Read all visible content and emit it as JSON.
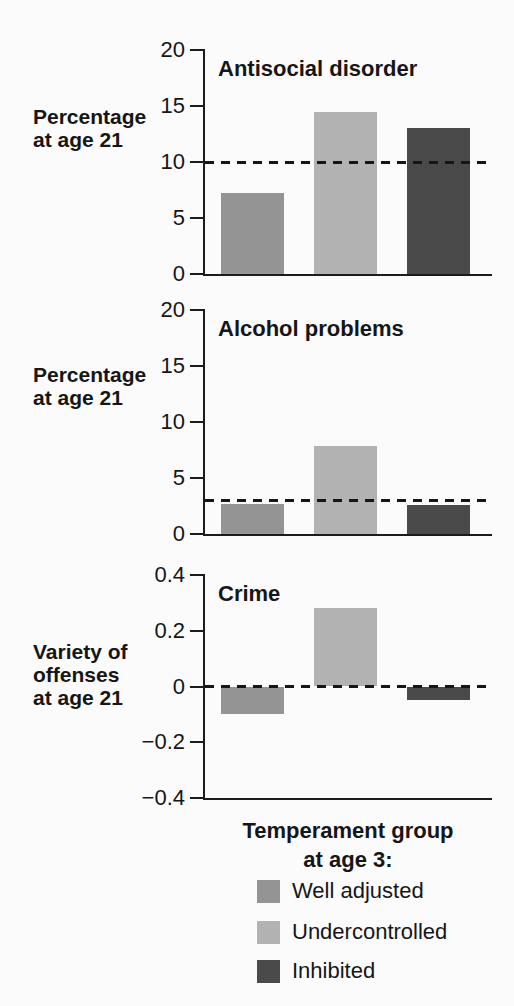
{
  "figure": {
    "background": "#fbfbfb",
    "axis_color": "#1c1c1c",
    "text_color": "#161616"
  },
  "x_axis_title": {
    "line1": "Temperament group",
    "line2": "at age 3:"
  },
  "legend": {
    "items": [
      {
        "label": "Well adjusted",
        "color": "#949494"
      },
      {
        "label": "Undercontrolled",
        "color": "#b2b2b2"
      },
      {
        "label": "Inhibited",
        "color": "#4a4a4a"
      }
    ]
  },
  "chart_data": [
    {
      "type": "bar",
      "title": "Antisocial disorder",
      "ylabel_lines": [
        "Percentage",
        "at age 21"
      ],
      "categories": [
        "Well adjusted",
        "Undercontrolled",
        "Inhibited"
      ],
      "values": [
        7.2,
        14.5,
        13.0
      ],
      "ylim": [
        0,
        20
      ],
      "yticks": [
        0,
        5,
        10,
        15,
        20
      ],
      "ytick_labels": [
        "0",
        "5",
        "10",
        "15",
        "20"
      ],
      "reference_line": 10,
      "reference_style": "dashed",
      "grid": false,
      "legend_position": "below-figure"
    },
    {
      "type": "bar",
      "title": "Alcohol problems",
      "ylabel_lines": [
        "Percentage",
        "at age 21"
      ],
      "categories": [
        "Well adjusted",
        "Undercontrolled",
        "Inhibited"
      ],
      "values": [
        2.7,
        7.9,
        2.6
      ],
      "ylim": [
        0,
        20
      ],
      "yticks": [
        0,
        5,
        10,
        15,
        20
      ],
      "ytick_labels": [
        "0",
        "5",
        "10",
        "15",
        "20"
      ],
      "reference_line": 3,
      "reference_style": "dashed",
      "grid": false,
      "legend_position": "below-figure"
    },
    {
      "type": "bar",
      "title": "Crime",
      "ylabel_lines": [
        "Variety of",
        "offenses",
        "at age 21"
      ],
      "categories": [
        "Well adjusted",
        "Undercontrolled",
        "Inhibited"
      ],
      "values": [
        -0.1,
        0.28,
        -0.05
      ],
      "ylim": [
        -0.4,
        0.4
      ],
      "yticks": [
        -0.4,
        -0.2,
        0,
        0.2,
        0.4
      ],
      "ytick_labels": [
        "−0.4",
        "−0.2",
        "0",
        "0.2",
        "0.4"
      ],
      "reference_line": 0,
      "reference_style": "dashed",
      "grid": false,
      "legend_position": "below-figure"
    }
  ]
}
